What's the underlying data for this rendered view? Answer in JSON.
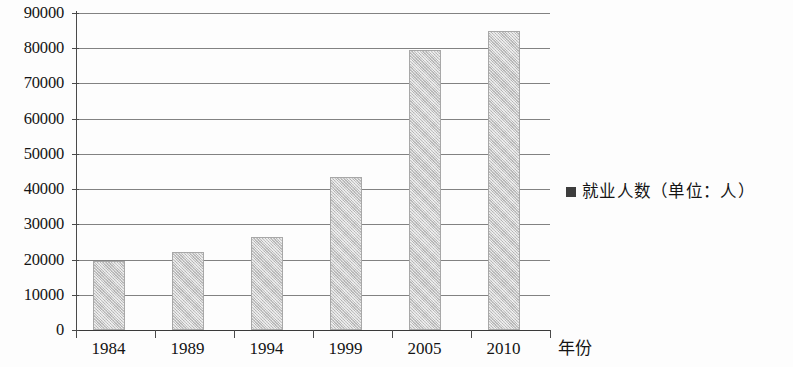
{
  "chart_data": {
    "type": "bar",
    "title": "",
    "subtitle": "",
    "xlabel": "年份",
    "ylabel": "",
    "categories": [
      "1984",
      "1989",
      "1994",
      "1999",
      "2005",
      "2010"
    ],
    "series": [
      {
        "name": "就业人数（单位：人）",
        "values": [
          19500,
          22200,
          26500,
          43500,
          79500,
          85000
        ]
      }
    ],
    "ylim": [
      0,
      90000
    ],
    "ytick_labels": [
      "90000",
      "80000",
      "70000",
      "60000",
      "50000",
      "40000",
      "30000",
      "20000",
      "10000",
      "0"
    ],
    "ytick_values": [
      90000,
      80000,
      70000,
      60000,
      50000,
      40000,
      30000,
      20000,
      10000,
      0
    ],
    "grid": true,
    "legend": {
      "position": "right",
      "entries": [
        {
          "label": "就业人数（单位：人）",
          "marker": "filled-square",
          "color": "#3d3d3d"
        }
      ]
    },
    "bar_color": "#c9c9c9",
    "axis_color": "#4a4a4a"
  }
}
